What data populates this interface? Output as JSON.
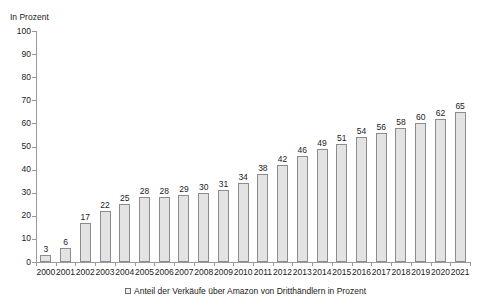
{
  "chart_data": {
    "type": "bar",
    "title": "",
    "subtitle": "",
    "xlabel": "",
    "ylabel": "In Prozent",
    "ylim": [
      0,
      100
    ],
    "ytick_step": 10,
    "yticks": [
      0,
      10,
      20,
      30,
      40,
      50,
      60,
      70,
      80,
      90,
      100
    ],
    "grid": false,
    "legend_position": "bottom-center",
    "legend": [
      "Anteil der Verkäufe über Amazon von Dritthändlern in Prozent"
    ],
    "categories": [
      "2000",
      "2001",
      "2002",
      "2003",
      "2004",
      "2005",
      "2006",
      "2007",
      "2008",
      "2009",
      "2010",
      "2011",
      "2012",
      "2013",
      "2014",
      "2015",
      "2016",
      "2017",
      "2018",
      "2019",
      "2020",
      "2021"
    ],
    "series": [
      {
        "name": "Anteil der Verkäufe über Amazon von Dritthändlern in Prozent",
        "values": [
          3,
          6,
          17,
          22,
          25,
          28,
          28,
          29,
          30,
          31,
          34,
          38,
          42,
          46,
          49,
          51,
          54,
          56,
          58,
          60,
          62,
          65
        ],
        "bar_fill": "#e3e3e3",
        "bar_border": "#8c8c8c",
        "data_labels": true
      }
    ]
  },
  "axis": {
    "y_title": "In Prozent"
  },
  "legend": {
    "marker": "square-outline-icon",
    "label": "Anteil der Verkäufe über Amazon von Dritthändlern in Prozent"
  },
  "colors": {
    "bar_fill": "#e3e3e3",
    "bar_border": "#8c8c8c",
    "axis": "#9a9a9a",
    "text": "#1a1a1a",
    "background": "#ffffff"
  }
}
